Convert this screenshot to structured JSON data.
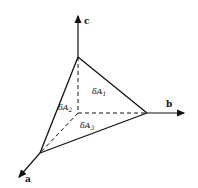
{
  "diagram": {
    "axes": {
      "a": "a",
      "b": "b",
      "c": "c"
    },
    "faces": {
      "dA1": "δA",
      "dA1_sub": "1",
      "dA2": "δA",
      "dA2_sub": "2",
      "dA3": "δA",
      "dA3_sub": "3"
    },
    "colors": {
      "stroke": "#111111",
      "background": "#ffffff"
    }
  }
}
